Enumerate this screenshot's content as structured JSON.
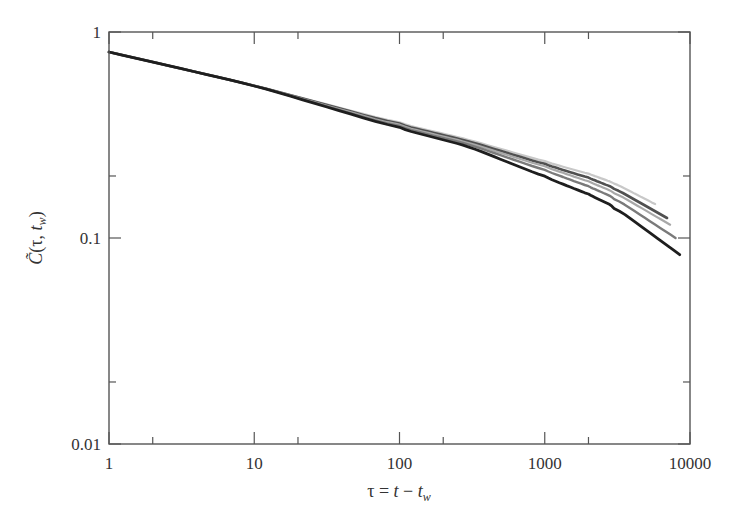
{
  "chart_data": {
    "type": "line",
    "title": "",
    "xlabel": "τ = t − t_w",
    "ylabel": "C̃(τ, t_w)",
    "xscale": "log",
    "yscale": "log",
    "xlim": [
      1,
      10000
    ],
    "ylim": [
      0.01,
      1
    ],
    "x_major_ticks": [
      1,
      10,
      100,
      1000,
      10000
    ],
    "x_tick_labels": [
      "1",
      "10",
      "100",
      "1000",
      "10000"
    ],
    "x_minor_ticks": [
      2,
      20,
      200,
      2000
    ],
    "y_major_ticks": [
      0.01,
      0.1,
      1
    ],
    "y_tick_labels": [
      "0.01",
      "0.1",
      "1"
    ],
    "y_minor_ticks": [
      0.02,
      0.2
    ],
    "grid": false,
    "legend": null,
    "series": [
      {
        "name": "curve-1 (lightest)",
        "color": "#c8c8c8",
        "x": [
          1,
          10,
          100,
          300,
          1000,
          2000,
          3000,
          5750
        ],
        "y": [
          0.8,
          0.55,
          0.36,
          0.3,
          0.235,
          0.205,
          0.185,
          0.146
        ]
      },
      {
        "name": "curve-2 (dark gray)",
        "color": "#505050",
        "x": [
          1,
          10,
          100,
          300,
          1000,
          2000,
          3000,
          6950
        ],
        "y": [
          0.8,
          0.55,
          0.355,
          0.295,
          0.228,
          0.196,
          0.175,
          0.125
        ]
      },
      {
        "name": "curve-3 (light gray)",
        "color": "#a8a8a8",
        "x": [
          1,
          10,
          100,
          300,
          1000,
          2000,
          3000,
          7300
        ],
        "y": [
          0.8,
          0.55,
          0.35,
          0.29,
          0.222,
          0.188,
          0.167,
          0.116
        ]
      },
      {
        "name": "curve-4 (medium gray)",
        "color": "#7a7a7a",
        "x": [
          1,
          10,
          100,
          300,
          1000,
          2000,
          3000,
          7950
        ],
        "y": [
          0.8,
          0.55,
          0.345,
          0.285,
          0.213,
          0.178,
          0.157,
          0.1
        ]
      },
      {
        "name": "curve-5 (darkest)",
        "color": "#1e1e1e",
        "x": [
          1,
          10,
          100,
          300,
          1000,
          2000,
          3000,
          8500
        ],
        "y": [
          0.8,
          0.55,
          0.34,
          0.278,
          0.198,
          0.163,
          0.142,
          0.083
        ]
      }
    ]
  },
  "plot": {
    "left_px": 109,
    "right_px": 690,
    "top_px": 32,
    "bottom_px": 444
  }
}
